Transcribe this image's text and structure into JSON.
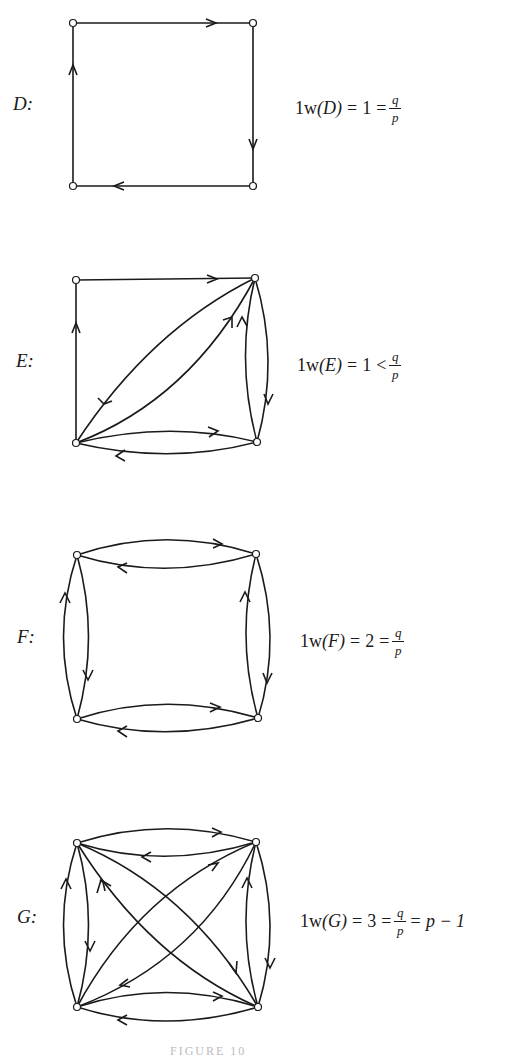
{
  "panels": [
    {
      "id": "D",
      "label": "D:",
      "formula": {
        "lhs": "1w",
        "arg": "(D)",
        "eq1": "=",
        "value": "1",
        "rel": "=",
        "frac_num": "q",
        "frac_den": "p",
        "tail": ""
      },
      "vertices": [
        [
          73,
          23
        ],
        [
          253,
          23
        ],
        [
          253,
          186
        ],
        [
          73,
          186
        ]
      ],
      "edges": "directed 4-cycle: top-left→top-right→bottom-right→bottom-left→top-left"
    },
    {
      "id": "E",
      "label": "E:",
      "formula": {
        "lhs": "1w",
        "arg": "(E)",
        "eq1": "=",
        "value": "1",
        "rel": "<",
        "frac_num": "q",
        "frac_den": "p",
        "tail": ""
      },
      "vertices": [
        [
          76,
          280
        ],
        [
          255,
          278
        ],
        [
          257,
          442
        ],
        [
          76,
          443
        ]
      ],
      "edges": "4-cycle plus bidirectional pairs on diagonal (BL-TR), right side, and bottom side"
    },
    {
      "id": "F",
      "label": "F:",
      "formula": {
        "lhs": "1w",
        "arg": "(F)",
        "eq1": "=",
        "value": "2",
        "rel": "=",
        "frac_num": "q",
        "frac_den": "p",
        "tail": ""
      },
      "vertices": [
        [
          77,
          555
        ],
        [
          256,
          554
        ],
        [
          258,
          718
        ],
        [
          77,
          719
        ]
      ],
      "edges": "bidirectional pair on each of the four sides"
    },
    {
      "id": "G",
      "label": "G:",
      "formula": {
        "lhs": "1w",
        "arg": "(G)",
        "eq1": "=",
        "value": "3",
        "rel": "=",
        "frac_num": "q",
        "frac_den": "p",
        "tail": "= p − 1"
      },
      "vertices": [
        [
          77,
          843
        ],
        [
          256,
          842
        ],
        [
          258,
          1007
        ],
        [
          77,
          1007
        ]
      ],
      "edges": "complete symmetric digraph on 4 vertices: bidirectional pairs on all sides and both diagonals"
    }
  ],
  "caption": "FIGURE 10"
}
